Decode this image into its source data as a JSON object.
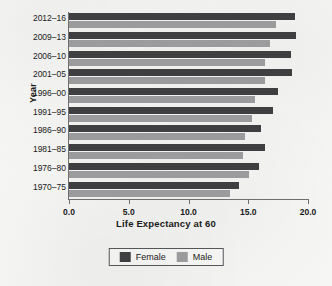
{
  "chart_data": {
    "type": "bar",
    "orientation": "horizontal",
    "title": "",
    "xlabel": "Life Expectancy at 60",
    "ylabel": "Year",
    "xlim": [
      0.0,
      20.0
    ],
    "xticks": [
      "0.0",
      "5.0",
      "10.0",
      "15.0",
      "20.0"
    ],
    "xtick_values": [
      0.0,
      5.0,
      10.0,
      15.0,
      20.0
    ],
    "grid": false,
    "legend_position": "bottom",
    "categories": [
      "2012–16",
      "2009–13",
      "2006–10",
      "2001–05",
      "1996–00",
      "1991–95",
      "1986–90",
      "1981–85",
      "1976–80",
      "1970–75"
    ],
    "series": [
      {
        "name": "Female",
        "color": "#3f3f42",
        "values": [
          18.9,
          19.0,
          18.6,
          18.7,
          17.5,
          17.1,
          16.1,
          16.4,
          15.9,
          14.2
        ]
      },
      {
        "name": "Male",
        "color": "#9b9b9d",
        "values": [
          17.3,
          16.8,
          16.4,
          16.4,
          15.6,
          15.3,
          14.7,
          14.6,
          15.1,
          13.5
        ]
      }
    ]
  },
  "legend": {
    "items": [
      {
        "label": "Female",
        "color": "#3f3f42"
      },
      {
        "label": "Male",
        "color": "#9b9b9d"
      }
    ]
  },
  "axes": {
    "x_title": "Life Expectancy at 60",
    "y_title": "Year"
  }
}
